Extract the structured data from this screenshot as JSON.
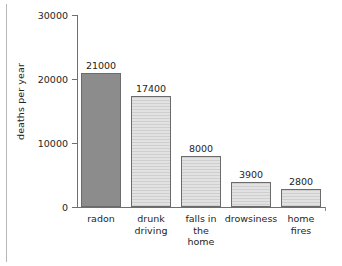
{
  "chart_data": {
    "type": "bar",
    "title": "",
    "xlabel": "",
    "ylabel": "deaths per year",
    "ylim": [
      0,
      30000
    ],
    "yticks": [
      0,
      10000,
      20000,
      30000
    ],
    "ytick_labels": [
      "0",
      "10000",
      "20000",
      "30000"
    ],
    "grid": false,
    "legend": null,
    "categories": [
      "radon",
      "drunk driving",
      "falls in the home",
      "drowsiness",
      "home fires"
    ],
    "category_label_lines": [
      [
        "radon"
      ],
      [
        "drunk",
        "driving"
      ],
      [
        "falls in",
        "the",
        "home"
      ],
      [
        "drowsiness"
      ],
      [
        "home",
        "fires"
      ]
    ],
    "values": [
      21000,
      17400,
      8000,
      3900,
      2800
    ],
    "value_labels": [
      "21000",
      "17400",
      "8000",
      "3900",
      "2800"
    ],
    "bar_styles": [
      "solid-dark-gray",
      "hatched-light-gray",
      "hatched-light-gray",
      "hatched-light-gray",
      "hatched-light-gray"
    ],
    "colors": {
      "bar_dark": "#8c8c8c",
      "bar_light": "#d8d8d8",
      "bar_border": "#6b6b6b",
      "axis": "#6f6f6f",
      "text": "#242424",
      "background": "#ffffff"
    }
  }
}
